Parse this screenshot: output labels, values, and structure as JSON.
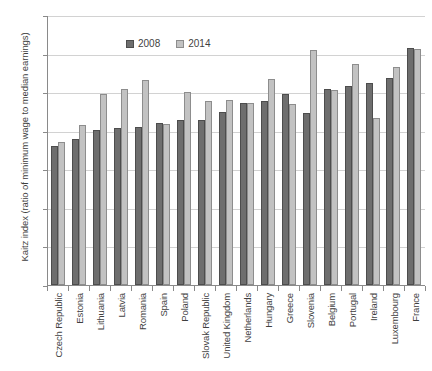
{
  "chart_data": {
    "type": "bar",
    "title": "",
    "xlabel": "",
    "ylabel": "Kaitz index (ratio of minimum wage to median earnings)",
    "ylim": [
      0,
      70
    ],
    "yticks": [
      0,
      10,
      20,
      30,
      40,
      50,
      60,
      70
    ],
    "grid": true,
    "legend_position": "top-left-inside",
    "categories": [
      "Czech Republic",
      "Estonia",
      "Lithuania",
      "Latvia",
      "Romania",
      "Spain",
      "Poland",
      "Slovak Republic",
      "United Kingdom",
      "Netherlands",
      "Hungary",
      "Greece",
      "Slovenia",
      "Belgium",
      "Portugal",
      "Ireland",
      "Luxembourg",
      "France"
    ],
    "series": [
      {
        "name": "2008",
        "color": "#6e6e6e",
        "values": [
          36.0,
          37.8,
          40.3,
          40.6,
          40.9,
          42.0,
          42.7,
          42.9,
          44.8,
          47.3,
          47.7,
          49.5,
          44.6,
          50.7,
          51.5,
          52.5,
          53.7,
          61.5
        ]
      },
      {
        "name": "2014",
        "color": "#c2c2c2",
        "values": [
          37.0,
          41.5,
          49.4,
          50.7,
          53.1,
          41.8,
          50.0,
          47.6,
          48.0,
          47.3,
          53.5,
          47.0,
          61.0,
          50.5,
          57.3,
          43.2,
          56.5,
          61.3
        ]
      }
    ]
  },
  "legend": {
    "items": [
      {
        "label": "2008"
      },
      {
        "label": "2014"
      }
    ]
  }
}
